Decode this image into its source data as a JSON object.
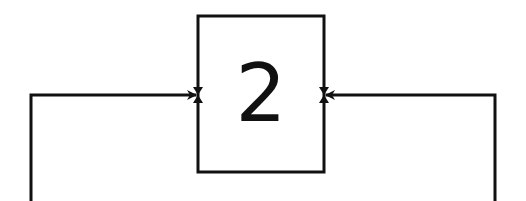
{
  "diagram": {
    "type": "flow",
    "colors": {
      "stroke": "#111111",
      "background": "#ffffff"
    },
    "nodes": [
      {
        "id": "node-2",
        "label": "2",
        "shape": "rectangle"
      }
    ],
    "edges": [
      {
        "from": "left-line",
        "to": "node-2",
        "side": "left",
        "arrow": "arrowhead"
      },
      {
        "from": "right-line",
        "to": "node-2",
        "side": "right",
        "arrow": "arrowhead"
      }
    ]
  }
}
